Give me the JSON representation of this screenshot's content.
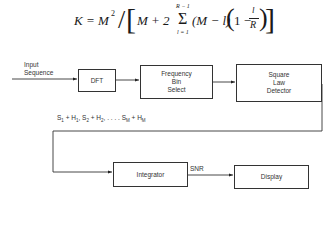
{
  "formula": {
    "lhs": "K = M",
    "exp": "2",
    "slash": "/",
    "lbracket": "[",
    "term1": "M + 2",
    "sigma": "Σ",
    "sum_upper": "R − 1",
    "sum_lower": "l = 1",
    "term2": "(M − l)",
    "lparen": "(",
    "one_minus": "1 −",
    "frac_num": "l",
    "frac_den": "R",
    "rparen": ")",
    "rbracket": "]"
  },
  "diagram": {
    "input_label_line1": "Input",
    "input_label_line2": "Sequence",
    "blocks": [
      {
        "id": "dft",
        "lines": [
          "DFT"
        ]
      },
      {
        "id": "freq-bin-select",
        "lines": [
          "Frequency",
          "Bin",
          "Select"
        ]
      },
      {
        "id": "square-law-detector",
        "lines": [
          "Square",
          "Law",
          "Detector"
        ]
      },
      {
        "id": "integrator",
        "lines": [
          "Integrator"
        ]
      },
      {
        "id": "display",
        "lines": [
          "Display"
        ]
      }
    ],
    "signal_label": {
      "s1": "S",
      "s1sub": "1",
      "h1": " + H",
      "h1sub": "1",
      "s2": ", S",
      "s2sub": "2",
      "h2": " + H",
      "h2sub": "2",
      "dots": ", . . . . S",
      "smsub": "M",
      "hm": " + H",
      "hmsub": "M"
    },
    "snr_label": "SNR"
  }
}
